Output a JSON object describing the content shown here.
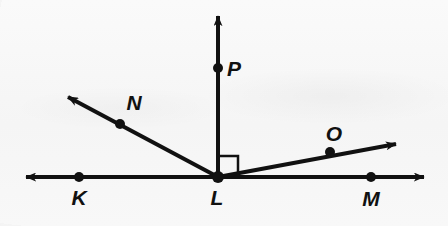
{
  "figure": {
    "kind": "geometry-diagram",
    "background_color": "#f7f7f7",
    "ink_color": "#111111",
    "stroke_width": 4,
    "dot_radius": 5
  },
  "points": [
    {
      "id": "K",
      "label": "K",
      "x": 79,
      "y": 177,
      "label_x": 79,
      "label_y": 205,
      "dot": true
    },
    {
      "id": "L",
      "label": "L",
      "x": 218,
      "y": 177,
      "label_x": 217,
      "label_y": 205,
      "dot": true
    },
    {
      "id": "M",
      "label": "M",
      "x": 371,
      "y": 177,
      "label_x": 371,
      "label_y": 206,
      "dot": true
    },
    {
      "id": "N",
      "label": "N",
      "x": 120,
      "y": 124,
      "label_x": 134,
      "label_y": 110,
      "dot": true
    },
    {
      "id": "O",
      "label": "O",
      "x": 330,
      "y": 152,
      "label_x": 334,
      "label_y": 141,
      "dot": true
    },
    {
      "id": "P",
      "label": "P",
      "x": 218,
      "y": 68,
      "label_x": 234,
      "label_y": 76,
      "dot": true
    }
  ],
  "line": {
    "id": "KM",
    "name": "horizontal-line-KM",
    "x1": 26,
    "y1": 177,
    "x2": 424,
    "y2": 177,
    "arrow_start": true,
    "arrow_end": true
  },
  "rays": [
    {
      "id": "LP",
      "name": "ray-LP",
      "x1": 218,
      "y1": 177,
      "x2": 218,
      "y2": 16,
      "arrow_end": true
    },
    {
      "id": "LN",
      "name": "ray-LN",
      "x1": 218,
      "y1": 177,
      "x2": 68,
      "y2": 97,
      "arrow_end": true
    },
    {
      "id": "LO",
      "name": "ray-LO",
      "x1": 218,
      "y1": 177,
      "x2": 396,
      "y2": 144,
      "arrow_end": true
    }
  ],
  "right_angle": {
    "name": "right-angle-marker-PLM",
    "vertex": "L",
    "x": 219,
    "y": 156,
    "size": 19,
    "stroke_width": 2,
    "measure": "90"
  }
}
